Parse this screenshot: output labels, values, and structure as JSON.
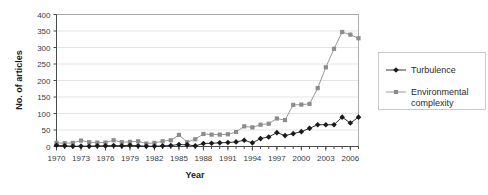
{
  "chart_data": {
    "type": "line",
    "title": "",
    "xlabel": "Year",
    "ylabel": "No. of articles",
    "xlim": [
      1970,
      2007
    ],
    "ylim": [
      0,
      400
    ],
    "ytick_step": 50,
    "yticks": [
      0,
      50,
      100,
      150,
      200,
      250,
      300,
      350,
      400
    ],
    "xticks": [
      1970,
      1973,
      1976,
      1979,
      1982,
      1985,
      1988,
      1991,
      1994,
      1997,
      2000,
      2003,
      2006
    ],
    "grid": "horizontal",
    "legend_position": "right",
    "x": [
      1970,
      1971,
      1972,
      1973,
      1974,
      1975,
      1976,
      1977,
      1978,
      1979,
      1980,
      1981,
      1982,
      1983,
      1984,
      1985,
      1986,
      1987,
      1988,
      1989,
      1990,
      1991,
      1992,
      1993,
      1994,
      1995,
      1996,
      1997,
      1998,
      1999,
      2000,
      2001,
      2002,
      2003,
      2004,
      2005,
      2006,
      2007
    ],
    "series": [
      {
        "name": "Turbulence",
        "color": "#1a1a1a",
        "marker": "diamond",
        "values": [
          4,
          2,
          1,
          1,
          1,
          2,
          2,
          3,
          2,
          4,
          2,
          1,
          1,
          2,
          3,
          6,
          5,
          2,
          9,
          10,
          11,
          12,
          14,
          19,
          11,
          24,
          29,
          42,
          33,
          39,
          45,
          55,
          66,
          66,
          66,
          89,
          71,
          89
        ]
      },
      {
        "name": "Environmental complexity",
        "color": "#8c8c8c",
        "marker": "square",
        "values": [
          11,
          10,
          11,
          18,
          13,
          12,
          12,
          19,
          13,
          14,
          16,
          9,
          11,
          16,
          19,
          35,
          13,
          22,
          38,
          36,
          36,
          37,
          44,
          61,
          58,
          66,
          69,
          85,
          80,
          126,
          127,
          129,
          177,
          240,
          296,
          347,
          339,
          328
        ]
      }
    ]
  },
  "axis": {
    "ytick_labels": [
      "400",
      "350",
      "300",
      "250",
      "200",
      "150",
      "100",
      "50",
      "0"
    ],
    "xtick_labels": [
      "1970",
      "1973",
      "1976",
      "1979",
      "1982",
      "1985",
      "1988",
      "1991",
      "1994",
      "1997",
      "2000",
      "2003",
      "2006"
    ],
    "x_title": "Year",
    "y_title": "No. of articles"
  },
  "legend": {
    "items": [
      {
        "label": "Turbulence",
        "color": "#1a1a1a",
        "marker": "diamond"
      },
      {
        "label": "Environmental",
        "label2": "complexity",
        "color": "#8c8c8c",
        "marker": "square"
      }
    ]
  }
}
